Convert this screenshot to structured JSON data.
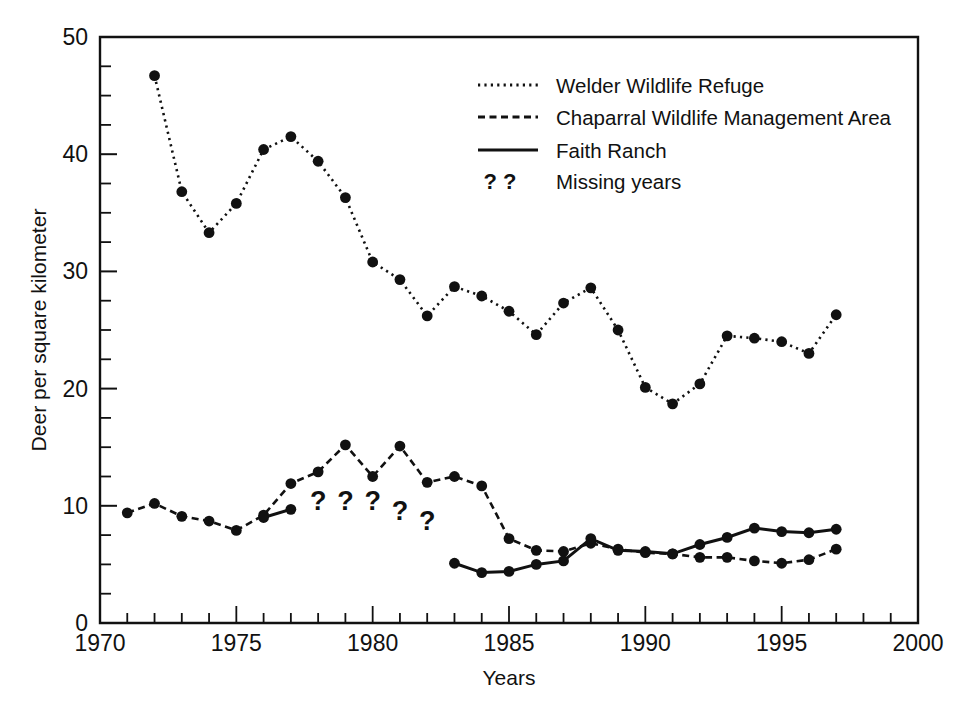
{
  "chart_data": {
    "type": "line",
    "title": "",
    "xlabel": "Years",
    "ylabel": "Deer per square kilometer",
    "xlim": [
      1970,
      2000
    ],
    "ylim": [
      0,
      50
    ],
    "x_ticks_major": [
      1970,
      1975,
      1980,
      1985,
      1990,
      1995,
      2000
    ],
    "x_tick_labels": [
      "1970",
      "1975",
      "1980",
      "1985",
      "1990",
      "1995",
      "2000"
    ],
    "x_tick_minor_step": 1,
    "y_ticks_major": [
      0,
      10,
      20,
      30,
      40,
      50
    ],
    "y_tick_labels": [
      "0",
      "10",
      "20",
      "30",
      "40",
      "50"
    ],
    "y_tick_minor_step": 2.5,
    "grid": false,
    "legend_position": "top-right",
    "series": [
      {
        "name": "Welder Wildlife Refuge",
        "style": "dotted",
        "marker": "filled-circle",
        "x": [
          1972,
          1973,
          1974,
          1975,
          1976,
          1977,
          1978,
          1979,
          1980,
          1981,
          1982,
          1983,
          1984,
          1985,
          1986,
          1987,
          1988,
          1989,
          1990,
          1991,
          1992,
          1993,
          1994,
          1995,
          1996,
          1997
        ],
        "values": [
          46.7,
          36.8,
          33.3,
          35.8,
          40.4,
          41.5,
          39.4,
          36.3,
          30.8,
          29.3,
          26.2,
          28.7,
          27.9,
          26.6,
          24.6,
          27.3,
          28.6,
          25.0,
          20.1,
          18.7,
          20.4,
          24.5,
          24.3,
          24.0,
          23.0,
          26.3
        ]
      },
      {
        "name": "Chaparral Wildlife Management Area",
        "style": "dashed",
        "marker": "filled-circle",
        "x": [
          1971,
          1972,
          1973,
          1974,
          1975,
          1976,
          1977,
          1978,
          1979,
          1980,
          1981,
          1982,
          1983,
          1984,
          1985,
          1986,
          1987,
          1988,
          1989,
          1990,
          1991,
          1992,
          1993,
          1994,
          1995,
          1996,
          1997
        ],
        "values": [
          9.4,
          10.2,
          9.1,
          8.7,
          7.9,
          9.2,
          11.9,
          12.9,
          15.2,
          12.5,
          15.1,
          12.0,
          12.5,
          11.7,
          7.2,
          6.2,
          6.1,
          6.8,
          6.3,
          6.0,
          5.9,
          5.6,
          5.6,
          5.3,
          5.1,
          5.4,
          6.3
        ]
      },
      {
        "name": "Faith Ranch",
        "style": "solid",
        "marker": "filled-circle",
        "segments": [
          {
            "x": [
              1976,
              1977
            ],
            "values": [
              9.0,
              9.7
            ]
          },
          {
            "x": [
              1983,
              1984,
              1985,
              1986,
              1987,
              1988,
              1989,
              1990,
              1991,
              1992,
              1993,
              1994,
              1995,
              1996,
              1997
            ],
            "values": [
              5.1,
              4.3,
              4.4,
              5.0,
              5.3,
              7.2,
              6.2,
              6.1,
              5.9,
              6.7,
              7.3,
              8.1,
              7.8,
              7.7,
              8.0
            ]
          }
        ]
      }
    ],
    "annotations": {
      "label": "Missing years",
      "marks": [
        {
          "text": "?",
          "x": 1978,
          "y": 9.6
        },
        {
          "text": "?",
          "x": 1979,
          "y": 9.6
        },
        {
          "text": "?",
          "x": 1980,
          "y": 9.6
        },
        {
          "text": "?",
          "x": 1981,
          "y": 8.8
        },
        {
          "text": "?",
          "x": 1982,
          "y": 7.9
        }
      ]
    }
  },
  "legend": {
    "items": [
      {
        "label": "Welder Wildlife Refuge",
        "style": "dotted"
      },
      {
        "label": "Chaparral Wildlife Management Area",
        "style": "dashed"
      },
      {
        "label": "Faith Ranch",
        "style": "solid"
      },
      {
        "label": "Missing years",
        "style": "question-marks",
        "swatch_text": "?  ?"
      }
    ]
  },
  "axes": {
    "x_title": "Years",
    "y_title": "Deer per square kilometer"
  }
}
